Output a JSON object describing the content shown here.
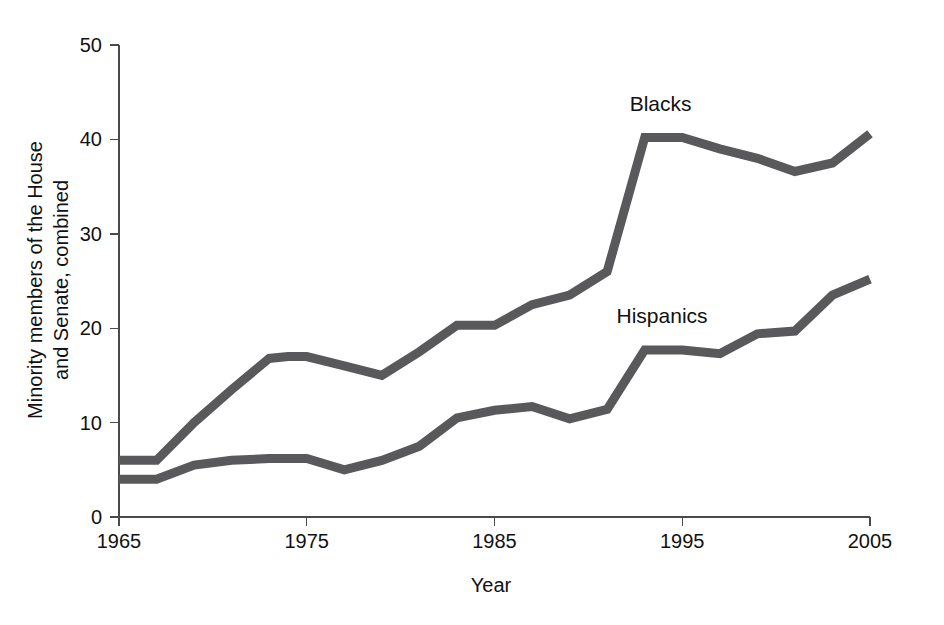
{
  "chart_data": {
    "type": "line",
    "title": "",
    "xlabel": "Year",
    "ylabel": "Minority members of the House and Senate, combined",
    "ylabel_line1": "Minority members of the House",
    "ylabel_line2": "and Senate, combined",
    "xlim": [
      1965,
      2005
    ],
    "ylim": [
      0,
      50
    ],
    "xticks": [
      1965,
      1975,
      1985,
      1995,
      2005
    ],
    "xtick_labels": [
      "1965",
      "1975",
      "1985",
      "1995",
      "2005"
    ],
    "yticks": [
      0,
      10,
      20,
      30,
      40,
      50
    ],
    "ytick_labels": [
      "0",
      "10",
      "20",
      "30",
      "40",
      "50"
    ],
    "grid": false,
    "legend_position": "inline-annotation",
    "line_color": "#59595b",
    "axis_color": "#4a4a4a",
    "background_color": "#ffffff",
    "series": [
      {
        "name": "Blacks",
        "label": "Blacks",
        "color": "#59595b",
        "label_x": 1992.2,
        "label_y": 43.0,
        "x": [
          1965,
          1967,
          1969,
          1971,
          1973,
          1974,
          1975,
          1977,
          1979,
          1981,
          1983,
          1985,
          1987,
          1989,
          1991,
          1993,
          1995,
          1997,
          1999,
          2001,
          2003,
          2005
        ],
        "values": [
          6.0,
          6.0,
          10.0,
          13.5,
          16.8,
          17.0,
          17.0,
          16.0,
          15.0,
          17.5,
          20.3,
          20.3,
          22.5,
          23.5,
          26.0,
          40.2,
          40.2,
          39.0,
          38.0,
          36.6,
          37.5,
          40.6
        ]
      },
      {
        "name": "Hispanics",
        "label": "Hispanics",
        "color": "#59595b",
        "label_x": 1991.5,
        "label_y": 20.6,
        "x": [
          1965,
          1967,
          1969,
          1971,
          1973,
          1975,
          1977,
          1979,
          1981,
          1983,
          1985,
          1987,
          1989,
          1991,
          1993,
          1995,
          1997,
          1999,
          2001,
          2003,
          2005
        ],
        "values": [
          4.0,
          4.0,
          5.5,
          6.0,
          6.2,
          6.2,
          5.0,
          6.0,
          7.5,
          10.5,
          11.3,
          11.7,
          10.4,
          11.4,
          17.7,
          17.7,
          17.3,
          19.4,
          19.7,
          23.5,
          25.2
        ]
      }
    ]
  }
}
